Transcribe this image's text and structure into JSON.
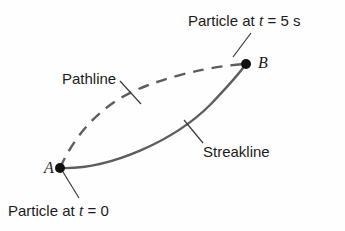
{
  "figure": {
    "background_color": "#fefefe",
    "width": 345,
    "height": 231
  },
  "labels": {
    "particle_t5_prefix": "Particle at ",
    "particle_t5_var": "t",
    "particle_t5_suffix": " = 5 s",
    "particle_t0_prefix": "Particle at ",
    "particle_t0_var": "t",
    "particle_t0_suffix": " = 0",
    "pathline": "Pathline",
    "streakline": "Streakline",
    "point_a": "A",
    "point_b": "B"
  },
  "colors": {
    "curve": "#5d5d5d",
    "text": "#1b1b1b",
    "marker": "#111111",
    "leader": "#3a3a3a"
  },
  "geometry": {
    "point_a": {
      "x": 60,
      "y": 168
    },
    "point_b": {
      "x": 246,
      "y": 64
    },
    "marker_radius": 5,
    "streakline_path": "M 60,168 C 110,170 175,140 210,105 C 232,82 241,71 246,64",
    "pathline_path": "M 60,168 C 78,128 108,100 146,86 C 185,71 225,65 246,64",
    "pathline_dash": "11 8",
    "leader_t5": {
      "x1": 233,
      "y1": 57,
      "x2": 251,
      "y2": 33
    },
    "leader_t0": {
      "x1": 63,
      "y1": 172,
      "x2": 79,
      "y2": 198
    },
    "leader_pathline": {
      "x1": 120,
      "y1": 81,
      "x2": 141,
      "y2": 104
    },
    "leader_streakline": {
      "x1": 184,
      "y1": 120,
      "x2": 203,
      "y2": 143
    }
  }
}
